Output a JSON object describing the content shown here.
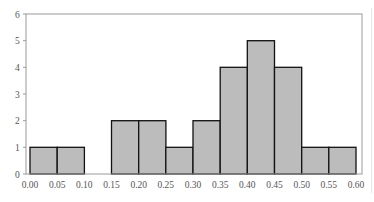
{
  "chart_data": {
    "type": "bar",
    "subtype": "histogram",
    "title": "",
    "xlabel": "",
    "ylabel": "",
    "bin_edges": [
      0.0,
      0.05,
      0.1,
      0.15,
      0.2,
      0.25,
      0.3,
      0.35,
      0.4,
      0.45,
      0.5,
      0.55,
      0.6
    ],
    "categories": [
      "0.00-0.05",
      "0.05-0.10",
      "0.10-0.15",
      "0.15-0.20",
      "0.20-0.25",
      "0.25-0.30",
      "0.30-0.35",
      "0.35-0.40",
      "0.40-0.45",
      "0.45-0.50",
      "0.50-0.55",
      "0.55-0.60"
    ],
    "values": [
      1,
      1,
      0,
      2,
      2,
      1,
      2,
      4,
      5,
      4,
      1,
      1
    ],
    "xlim": [
      0.0,
      0.6
    ],
    "ylim": [
      0,
      6
    ],
    "x_tick_labels": [
      "0.00",
      "0.05",
      "0.10",
      "0.15",
      "0.20",
      "0.25",
      "0.30",
      "0.35",
      "0.40",
      "0.45",
      "0.50",
      "0.55",
      "0.60"
    ],
    "y_tick_labels": [
      "0",
      "1",
      "2",
      "3",
      "4",
      "5",
      "6"
    ],
    "grid": false,
    "legend": null,
    "colors": {
      "bar_fill": "#bcbcbc",
      "bar_edge": "#111111",
      "frame": "#9a9a9a",
      "text": "#555555"
    }
  }
}
